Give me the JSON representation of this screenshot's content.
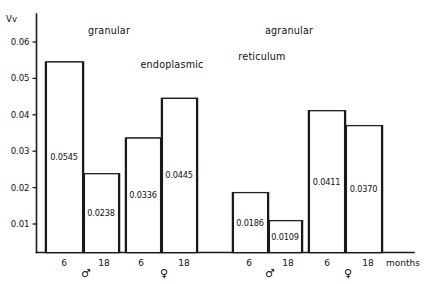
{
  "chart_data": {
    "type": "bar",
    "title": "",
    "title_lines": [
      {
        "text": "granular",
        "x": 109,
        "y": 34
      },
      {
        "text": "agranular",
        "x": 289,
        "y": 34
      },
      {
        "text": "endoplasmic",
        "x": 172,
        "y": 68
      },
      {
        "text": "reticulum",
        "x": 262,
        "y": 60
      }
    ],
    "ylabel": "Vv",
    "xlabel": "months",
    "ylim": [
      0,
      0.065
    ],
    "yticks": [
      0.01,
      0.02,
      0.03,
      0.04,
      0.05,
      0.06
    ],
    "ytick_labels": [
      "0.01",
      "0.02",
      "0.03",
      "0.04",
      "0.05",
      "0.06"
    ],
    "grid": false,
    "legend": "none",
    "categories": [
      "6",
      "18",
      "6",
      "18",
      "6",
      "18",
      "6",
      "18"
    ],
    "values": [
      0.0545,
      0.0238,
      0.0336,
      0.0445,
      0.0186,
      0.0109,
      0.0411,
      0.037
    ],
    "value_labels": [
      "0.0545",
      "0.0238",
      "0.0336",
      "0.0445",
      "0.0186",
      "0.0109",
      "0.0411",
      "0.0370"
    ],
    "bars": [
      {
        "label": "0.0545",
        "value": 0.0545,
        "age": "6",
        "sex": "male",
        "group": "granular-male",
        "x": 45,
        "w": 38
      },
      {
        "label": "0.0238",
        "value": 0.0238,
        "age": "18",
        "sex": "male",
        "group": "granular-male",
        "x": 83,
        "w": 36
      },
      {
        "label": "0.0336",
        "value": 0.0336,
        "age": "6",
        "sex": "female",
        "group": "granular-female",
        "x": 125,
        "w": 36
      },
      {
        "label": "0.0445",
        "value": 0.0445,
        "age": "18",
        "sex": "female",
        "group": "granular-female",
        "x": 161,
        "w": 36
      },
      {
        "label": "0.0186",
        "value": 0.0186,
        "age": "6",
        "sex": "male",
        "group": "agranular-male",
        "x": 232,
        "w": 36
      },
      {
        "label": "0.0109",
        "value": 0.0109,
        "age": "18",
        "sex": "male",
        "group": "agranular-male",
        "x": 268,
        "w": 34
      },
      {
        "label": "0.0411",
        "value": 0.0411,
        "age": "6",
        "sex": "female",
        "group": "agranular-female",
        "x": 308,
        "w": 37
      },
      {
        "label": "0.0370",
        "value": 0.037,
        "age": "18",
        "sex": "female",
        "group": "agranular-female",
        "x": 345,
        "w": 37
      }
    ],
    "groups": [
      {
        "name": "granular-male",
        "sex_symbol": "♂",
        "sex_x": 86,
        "ticks": [
          {
            "text": "6",
            "x": 64
          },
          {
            "text": "18",
            "x": 104
          }
        ]
      },
      {
        "name": "granular-female",
        "sex_symbol": "♀",
        "sex_x": 164,
        "ticks": [
          {
            "text": "6",
            "x": 141
          },
          {
            "text": "18",
            "x": 184
          }
        ]
      },
      {
        "name": "agranular-male",
        "sex_symbol": "♂",
        "sex_x": 270,
        "ticks": [
          {
            "text": "6",
            "x": 249
          },
          {
            "text": "18",
            "x": 288
          }
        ]
      },
      {
        "name": "agranular-female",
        "sex_symbol": "♀",
        "sex_x": 348,
        "ticks": [
          {
            "text": "6",
            "x": 327
          },
          {
            "text": "18",
            "x": 368
          }
        ]
      }
    ],
    "colors": {
      "ink": "#1a1a1a",
      "background": "#ffffff",
      "bar_fill": "none"
    }
  }
}
